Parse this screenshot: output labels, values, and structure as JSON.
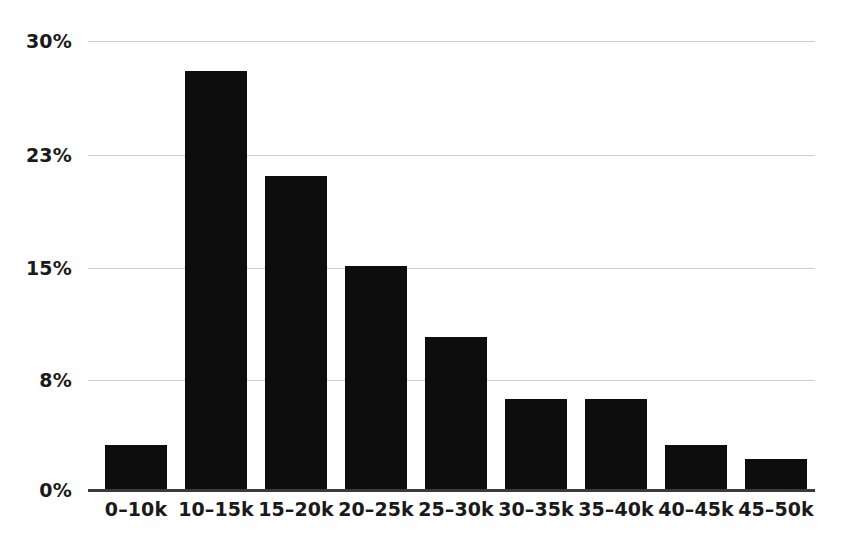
{
  "chart_data": {
    "type": "bar",
    "title": "",
    "subtitle": "",
    "xlabel": "",
    "ylabel": "",
    "categories": [
      "0–10k",
      "10–15k",
      "15–20k",
      "20–25k",
      "25–30k",
      "30–35k",
      "35–40k",
      "40–45k",
      "45–50k"
    ],
    "values": [
      3,
      28,
      21,
      15,
      10.2,
      6.1,
      6.1,
      3,
      2.1
    ],
    "value_labels": [
      "3%",
      "28%",
      "21%",
      "15%",
      "10%",
      "6%",
      "6%",
      "3%",
      "2%"
    ],
    "ylim": [
      0,
      30
    ],
    "ytick_values": [
      0,
      8,
      15,
      23,
      30
    ],
    "ytick_labels": [
      "0%",
      "8%",
      "15%",
      "23%",
      "30%"
    ],
    "grid": true,
    "grid_axis": "y",
    "legend": false,
    "legend_position": "none",
    "bar_color": "#0d0d0d",
    "gridline_color": "#cfcfcf",
    "axis_color": "#3a3a3a",
    "background_color": "#ffffff",
    "text_color": "#1a1a1a"
  }
}
